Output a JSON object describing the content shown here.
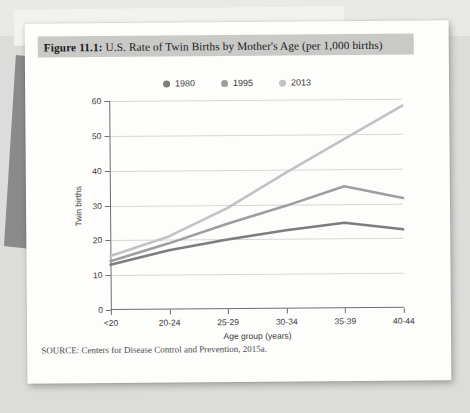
{
  "figure": {
    "label": "Figure 11.1:",
    "title": "U.S. Rate of Twin Births by Mother's Age (per 1,000 births)",
    "full_title": "Figure 11.1: U.S. Rate of Twin Births by Mother's Age (per 1,000 births)",
    "source_note": "SOURCE: Centers for Disease Control and Prevention, 2015a."
  },
  "colors": {
    "series_1980": "#7d7d7d",
    "series_1995": "#9e9e9e",
    "series_2013": "#c2c2c2",
    "axis": "#6e6e6e",
    "gridline": "#d6d6d4",
    "title_banner": "#c9c9c7",
    "page": "#fdfdfc",
    "backdrop": "#dcdcda"
  },
  "chart_data": {
    "type": "line",
    "title": "U.S. Rate of Twin Births by Mother's Age (per 1,000 births)",
    "xlabel": "Age group (years)",
    "ylabel": "Twin births",
    "categories": [
      "<20",
      "20-24",
      "25-29",
      "30-34",
      "35-39",
      "40-44"
    ],
    "ylim": [
      0,
      60
    ],
    "yticks": [
      0,
      10,
      20,
      30,
      40,
      50,
      60
    ],
    "grid": true,
    "legend_position": "top-center",
    "series": [
      {
        "name": "1980",
        "color": "#7d7d7d",
        "values": [
          13,
          17,
          20,
          22.5,
          24.5,
          22.5
        ]
      },
      {
        "name": "1995",
        "color": "#9e9e9e",
        "values": [
          14,
          19,
          24.5,
          29.5,
          35,
          31.5
        ]
      },
      {
        "name": "2013",
        "color": "#c2c2c2",
        "values": [
          15.5,
          21,
          29,
          39,
          48.5,
          58
        ]
      }
    ]
  }
}
